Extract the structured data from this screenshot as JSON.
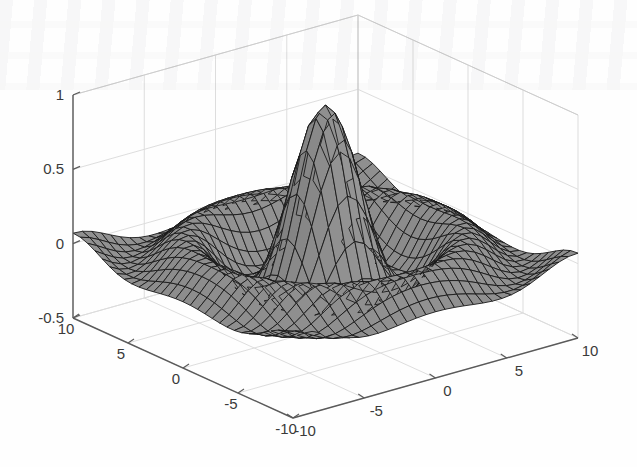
{
  "figure": {
    "width": 637,
    "height": 467,
    "background": "#fefefe",
    "type": "matlab-3d-surface-figure"
  },
  "chart_data": {
    "type": "surface",
    "title": "",
    "subtitle": "",
    "xlabel": "",
    "ylabel": "",
    "zlabel": "",
    "function": "sin(r)/r  (sinc / sombrero), r = sqrt(x^2 + y^2)",
    "shading": "faceted-grayscale",
    "colormap": "gray",
    "grid": true,
    "legend": null,
    "legend_position": "none",
    "projection": "orthographic",
    "view_azimuth_deg": -37.5,
    "view_elevation_deg": 30,
    "xlim": [
      -10,
      10
    ],
    "ylim": [
      -10,
      10
    ],
    "zlim": [
      -0.5,
      1
    ],
    "x_ticks": [
      -10,
      -5,
      0,
      5,
      10
    ],
    "x_tick_labels": [
      "-10",
      "-5",
      "0",
      "5",
      "10"
    ],
    "y_ticks": [
      -10,
      -5,
      0,
      5,
      10
    ],
    "y_tick_labels": [
      "10",
      "5",
      "0",
      "-5",
      "-10"
    ],
    "z_ticks": [
      -0.5,
      0,
      0.5,
      1
    ],
    "z_tick_labels": [
      "-0.5",
      "0",
      "0.5",
      "1"
    ],
    "mesh_resolution": 30,
    "surface_min": -0.2172,
    "surface_max": 1.0,
    "peak_value": 1.0,
    "peak_at": [
      0,
      0
    ],
    "first_ring_min_value": -0.2172,
    "first_ring_radius": 4.493,
    "second_ring_max_value": 0.1284,
    "second_ring_radius": 7.725,
    "face_color_dark": "#6f6f6f",
    "face_color_light": "#9a9a9a",
    "edge_color": "#1a1a1a",
    "axis_color": "#5a5a5a",
    "grid_color": "#dcdcdc",
    "tick_label_color": "#3a3a3a"
  },
  "axes": {
    "z_axis": {
      "name": "vertical-axis",
      "ticks": [
        "1",
        "0.5",
        "0",
        "-0.5"
      ]
    },
    "y_axis_front_left": {
      "name": "left-front-axis",
      "ticks": [
        "10",
        "5",
        "0",
        "-5",
        "-10"
      ]
    },
    "x_axis_front_right": {
      "name": "right-front-axis",
      "ticks": [
        "-10",
        "-5",
        "0",
        "5",
        "10"
      ]
    }
  }
}
